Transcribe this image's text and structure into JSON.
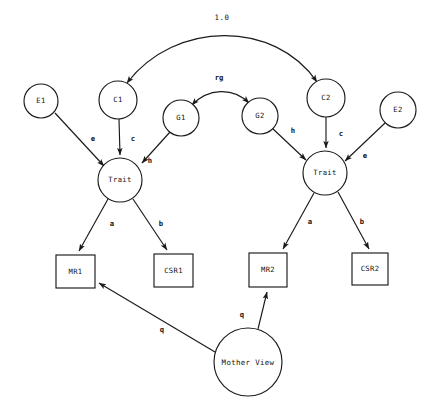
{
  "diagram": {
    "type": "path-diagram",
    "background_color": "#ffffff",
    "stroke_color": "#1a1a1a",
    "nodes": {
      "e1": {
        "label": "E1",
        "shape": "circle",
        "cx": 41,
        "cy": 101,
        "r": 17
      },
      "c1": {
        "label": "C1",
        "shape": "circle",
        "cx": 118,
        "cy": 100,
        "r": 19
      },
      "g1": {
        "label": "G1",
        "shape": "circle",
        "cx": 181,
        "cy": 118,
        "r": 18
      },
      "g2": {
        "label": "G2",
        "shape": "circle",
        "cx": 260,
        "cy": 116,
        "r": 18
      },
      "c2": {
        "label": "C2",
        "shape": "circle",
        "cx": 326,
        "cy": 98,
        "r": 19
      },
      "e2": {
        "label": "E2",
        "shape": "circle",
        "cx": 398,
        "cy": 110,
        "r": 18
      },
      "trait1": {
        "label": "Trait",
        "shape": "circle",
        "cx": 120,
        "cy": 180,
        "r": 22
      },
      "trait2": {
        "label": "Trait",
        "shape": "circle",
        "cx": 325,
        "cy": 173,
        "r": 22
      },
      "mother_view": {
        "label": "Mother View",
        "shape": "circle",
        "cx": 248,
        "cy": 362,
        "r": 34
      },
      "mr1": {
        "label": "MR1",
        "shape": "rect",
        "x": 56,
        "y": 255,
        "w": 39,
        "h": 33
      },
      "csr1": {
        "label": "CSR1",
        "shape": "rect",
        "x": 154,
        "y": 254,
        "w": 39,
        "h": 33
      },
      "mr2": {
        "label": "MR2",
        "shape": "rect",
        "x": 249,
        "y": 253,
        "w": 38,
        "h": 34
      },
      "csr2": {
        "label": "CSR2",
        "shape": "rect",
        "x": 352,
        "y": 253,
        "w": 36,
        "h": 32
      }
    },
    "edges": [
      {
        "id": "c1-c2",
        "from": "c1",
        "to": "c2",
        "label": "1.0",
        "style": "double-arrow-arc"
      },
      {
        "id": "g1-g2",
        "from": "g1",
        "to": "g2",
        "label": "rg",
        "style": "double-arrow-arc"
      },
      {
        "id": "e1-trait1",
        "from": "e1",
        "to": "trait1",
        "label": "e",
        "style": "arrow"
      },
      {
        "id": "c1-trait1",
        "from": "c1",
        "to": "trait1",
        "label": "c",
        "style": "arrow"
      },
      {
        "id": "g1-trait1",
        "from": "g1",
        "to": "trait1",
        "label": "h",
        "style": "arrow"
      },
      {
        "id": "g2-trait2",
        "from": "g2",
        "to": "trait2",
        "label": "h",
        "style": "arrow"
      },
      {
        "id": "c2-trait2",
        "from": "c2",
        "to": "trait2",
        "label": "c",
        "style": "arrow"
      },
      {
        "id": "e2-trait2",
        "from": "e2",
        "to": "trait2",
        "label": "e",
        "style": "arrow"
      },
      {
        "id": "trait1-mr1",
        "from": "trait1",
        "to": "mr1",
        "label": "a",
        "style": "arrow"
      },
      {
        "id": "trait1-csr1",
        "from": "trait1",
        "to": "csr1",
        "label": "b",
        "style": "arrow"
      },
      {
        "id": "trait2-mr2",
        "from": "trait2",
        "to": "mr2",
        "label": "a",
        "style": "arrow"
      },
      {
        "id": "trait2-csr2",
        "from": "trait2",
        "to": "csr2",
        "label": "b",
        "style": "arrow"
      },
      {
        "id": "mother-mr1",
        "from": "mother_view",
        "to": "mr1",
        "label": "q",
        "style": "arrow"
      },
      {
        "id": "mother-mr2",
        "from": "mother_view",
        "to": "mr2",
        "label": "q",
        "style": "arrow"
      }
    ],
    "labels": {
      "one_zero": {
        "text": "1.0",
        "x": 222,
        "y": 18
      },
      "rg": {
        "text": "rg",
        "x": 219,
        "y": 78
      },
      "e_left": {
        "text": "e",
        "x": 93,
        "y": 139
      },
      "c_left": {
        "text": "c",
        "x": 133,
        "y": 139
      },
      "h_left": {
        "text": "h",
        "x": 150,
        "y": 161
      },
      "h_right": {
        "text": "h",
        "x": 293,
        "y": 131
      },
      "c_right": {
        "text": "c",
        "x": 341,
        "y": 134
      },
      "e_right": {
        "text": "e",
        "x": 365,
        "y": 156
      },
      "a_left": {
        "text": "a",
        "x": 112,
        "y": 224
      },
      "b_left": {
        "text": "b",
        "x": 161,
        "y": 224
      },
      "a_right": {
        "text": "a",
        "x": 310,
        "y": 222
      },
      "b_right": {
        "text": "b",
        "x": 362,
        "y": 222
      },
      "q_left": {
        "text": "q",
        "x": 162,
        "y": 330
      },
      "q_right": {
        "text": "q",
        "x": 242,
        "y": 315
      }
    }
  }
}
